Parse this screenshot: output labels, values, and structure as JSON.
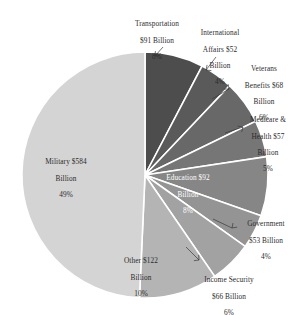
{
  "chart_data": {
    "type": "pie",
    "title": "",
    "subtitle": "",
    "xlabel": "",
    "ylabel": "",
    "legend_position": "labels-with-leader-lines",
    "grid": false,
    "value_unit": "Billion",
    "currency": "$",
    "start_angle_deg": 0,
    "direction": "clockwise",
    "categories": [
      "Transportation",
      "International Affairs",
      "Veterans Benefits",
      "Medicare & Health",
      "Education",
      "Government",
      "Income Security",
      "Other",
      "Military"
    ],
    "values": [
      91,
      52,
      68,
      57,
      92,
      53,
      66,
      122,
      584
    ],
    "percents": [
      8,
      4,
      6,
      5,
      8,
      4,
      6,
      10,
      49
    ],
    "colors": [
      "#4d4d4d",
      "#5a5a5a",
      "#686868",
      "#767676",
      "#868686",
      "#949494",
      "#a2a2a2",
      "#b4b4b4",
      "#d4d4d4"
    ],
    "total_value": 1185,
    "slices": [
      {
        "name": "Transportation",
        "value": 91,
        "percent": 8,
        "label": "Transportation\n$91 Billion\n8%",
        "color": "#4d4d4d"
      },
      {
        "name": "International Affairs",
        "value": 52,
        "percent": 4,
        "label": "International\nAffairs $52\nBillion\n4%",
        "color": "#5a5a5a"
      },
      {
        "name": "Veterans Benefits",
        "value": 68,
        "percent": 6,
        "label": "Veterans\nBenefits $68\nBillion\n6%",
        "color": "#686868"
      },
      {
        "name": "Medicare & Health",
        "value": 57,
        "percent": 5,
        "label": "Medicare &\nHealth $57\nBillion\n5%",
        "color": "#767676"
      },
      {
        "name": "Education",
        "value": 92,
        "percent": 8,
        "label": "Education $92\nBillion\n8%",
        "color": "#868686"
      },
      {
        "name": "Government",
        "value": 53,
        "percent": 4,
        "label": "Government\n$53 Billion\n4%",
        "color": "#949494"
      },
      {
        "name": "Income Security",
        "value": 66,
        "percent": 6,
        "label": "Income Security\n$66 Billion\n6%",
        "color": "#a2a2a2"
      },
      {
        "name": "Other",
        "value": 122,
        "percent": 10,
        "label": "Other $122\nBillion\n10%",
        "color": "#b4b4b4"
      },
      {
        "name": "Military",
        "value": 584,
        "percent": 49,
        "label": "Military $584\nBillion\n49%",
        "color": "#d4d4d4"
      }
    ]
  },
  "labels": {
    "transportation": {
      "l1": "Transportation",
      "l2": "$91 Billion",
      "l3": "8%",
      "l4": ""
    },
    "international": {
      "l1": "International",
      "l2": "Affairs $52",
      "l3": "Billion",
      "l4": "4%"
    },
    "veterans": {
      "l1": "Veterans",
      "l2": "Benefits $68",
      "l3": "Billion",
      "l4": "6%"
    },
    "medicare": {
      "l1": "Medicare &",
      "l2": "Health $57",
      "l3": "Billion",
      "l4": "5%"
    },
    "education": {
      "l1": "Education $92",
      "l2": "Billion",
      "l3": "8%",
      "l4": ""
    },
    "government": {
      "l1": "Government",
      "l2": "$53 Billion",
      "l3": "4%",
      "l4": ""
    },
    "income_security": {
      "l1": "Income Security",
      "l2": "$66 Billion",
      "l3": "6%",
      "l4": ""
    },
    "other": {
      "l1": "Other $122",
      "l2": "Billion",
      "l3": "10%",
      "l4": ""
    },
    "military": {
      "l1": "Military $584",
      "l2": "Billion",
      "l3": "49%",
      "l4": ""
    }
  }
}
